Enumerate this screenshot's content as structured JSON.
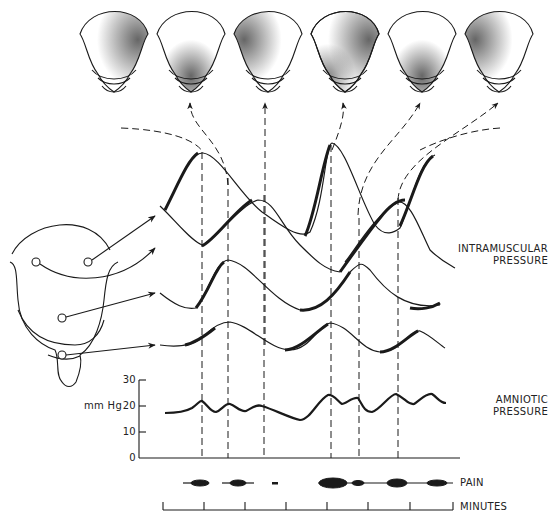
{
  "labels": {
    "intramuscular_line1": "INTRAMUSCULAR",
    "intramuscular_line2": "PRESSURE",
    "amniotic_line1": "AMNIOTIC",
    "amniotic_line2": "PRESSURE",
    "pain": "PAIN",
    "minutes": "MINUTES",
    "y_unit": "mm Hg"
  },
  "amniotic_axis": {
    "ticks": [
      "30",
      "20",
      "10",
      "0"
    ],
    "ylim": [
      0,
      30
    ]
  },
  "uterus_views": [
    {
      "index": 1,
      "shading": "upper-right fundus"
    },
    {
      "index": 2,
      "shading": "lower segment"
    },
    {
      "index": 3,
      "shading": "upper-left fundus"
    },
    {
      "index": 4,
      "shading": "upper-right and lower-left"
    },
    {
      "index": 5,
      "shading": "lower segment"
    },
    {
      "index": 6,
      "shading": "upper-left fundus"
    }
  ],
  "recording_sites": [
    "upper right fundus",
    "upper left fundus",
    "mid body",
    "lower segment"
  ],
  "minutes_ticks": 8,
  "colors": {
    "ink": "#1a1a1a",
    "background": "#ffffff"
  }
}
